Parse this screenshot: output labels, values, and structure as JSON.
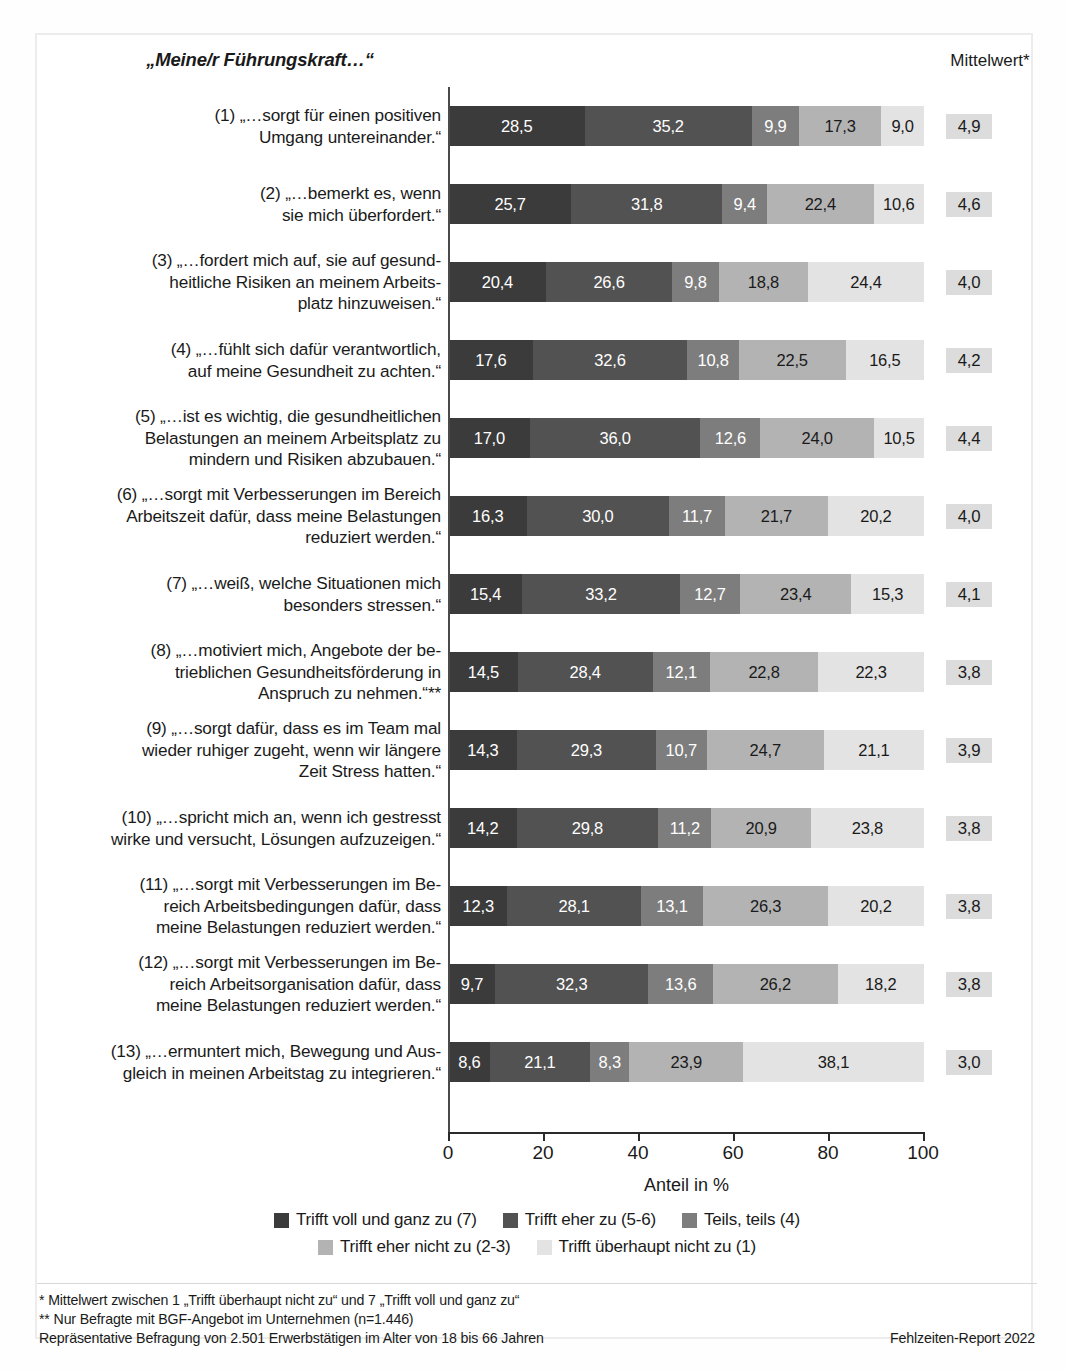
{
  "header": {
    "question_title": "„Meine/r Führungskraft…“",
    "mean_column_title": "Mittelwert*"
  },
  "axis": {
    "xlabel": "Anteil in %",
    "ticks": [
      "0",
      "20",
      "40",
      "60",
      "80",
      "100"
    ]
  },
  "legend": [
    {
      "label": "Trifft voll und ganz zu (7)",
      "color": "#3b3b3b"
    },
    {
      "label": "Trifft eher zu (5-6)",
      "color": "#525252"
    },
    {
      "label": "Teils, teils (4)",
      "color": "#7d7d7d"
    },
    {
      "label": "Trifft eher nicht zu (2-3)",
      "color": "#b3b3b3"
    },
    {
      "label": "Trifft überhaupt nicht zu (1)",
      "color": "#e3e3e3"
    }
  ],
  "footnotes": {
    "line1": "*  Mittelwert zwischen 1 „Trifft überhaupt nicht zu“ und 7 „Trifft voll und ganz zu“",
    "line2": "** Nur Befragte mit BGF-Angebot im Unternehmen (n=1.446)",
    "line3": "Repräsentative Befragung von 2.501 Erwerbstätigen im Alter von 18 bis 66 Jahren",
    "source": "Fehlzeiten-Report 2022"
  },
  "chart_data": {
    "type": "bar",
    "title": "„Meine/r Führungskraft…“",
    "xlabel": "Anteil in %",
    "ylabel": "",
    "xlim": [
      0,
      100
    ],
    "grid": false,
    "legend_position": "bottom",
    "stacked": true,
    "normalized_percent": true,
    "orientation": "horizontal",
    "categories": [
      "(1) „…sorgt für einen positiven Umgang untereinander.“",
      "(2) „…bemerkt es, wenn sie mich überfordert.“",
      "(3) „…fordert mich auf, sie auf gesundheitliche Risiken an meinem Arbeitsplatz hinzuweisen.“",
      "(4) „…fühlt sich dafür verantwortlich, auf meine Gesundheit zu achten.“",
      "(5) „…ist es wichtig, die gesundheitlichen Belastungen an meinem Arbeitsplatz zu mindern und Risiken abzubauen.“",
      "(6) „…sorgt mit Verbesserungen im Bereich Arbeitszeit dafür, dass meine Belastungen reduziert werden.“",
      "(7) „…weiß, welche Situationen mich besonders stressen.“",
      "(8) „…motiviert mich, Angebote der betrieblichen Gesundheitsförderung in Anspruch zu nehmen.“**",
      "(9) „…sorgt dafür, dass es im Team mal wieder ruhiger zugeht, wenn wir längere Zeit Stress hatten.“",
      "(10) „…spricht mich an, wenn ich gestresst wirke und versucht, Lösungen aufzuzeigen.“",
      "(11) „…sorgt mit Verbesserungen im Bereich Arbeitsbedingungen dafür, dass meine Belastungen reduziert werden.“",
      "(12) „…sorgt mit Verbesserungen im Bereich Arbeitsorganisation dafür, dass meine Belastungen reduziert werden.“",
      "(13) „…ermuntert mich, Bewegung und Ausgleich in meinen Arbeitstag zu integrieren.“"
    ],
    "series": [
      {
        "name": "Trifft voll und ganz zu (7)",
        "color": "#3b3b3b",
        "values": [
          28.5,
          25.7,
          20.4,
          17.6,
          17.0,
          16.3,
          15.4,
          14.5,
          14.3,
          14.2,
          12.3,
          9.7,
          8.6
        ]
      },
      {
        "name": "Trifft eher zu (5-6)",
        "color": "#525252",
        "values": [
          35.2,
          31.8,
          26.6,
          32.6,
          36.0,
          30.0,
          33.2,
          28.4,
          29.3,
          29.8,
          28.1,
          32.3,
          21.1
        ]
      },
      {
        "name": "Teils, teils (4)",
        "color": "#7d7d7d",
        "values": [
          9.9,
          9.4,
          9.8,
          10.8,
          12.6,
          11.7,
          12.7,
          12.1,
          10.7,
          11.2,
          13.1,
          13.6,
          8.3
        ]
      },
      {
        "name": "Trifft eher nicht zu (2-3)",
        "color": "#b3b3b3",
        "values": [
          17.3,
          22.4,
          18.8,
          22.5,
          24.0,
          21.7,
          23.4,
          22.8,
          24.7,
          20.9,
          26.3,
          26.2,
          23.9
        ]
      },
      {
        "name": "Trifft überhaupt nicht zu (1)",
        "color": "#e3e3e3",
        "values": [
          9.0,
          10.6,
          24.4,
          16.5,
          10.5,
          20.2,
          15.3,
          22.3,
          21.1,
          23.8,
          20.2,
          18.2,
          38.1
        ]
      }
    ],
    "mean_column_title": "Mittelwert*",
    "means": [
      "4,9",
      "4,6",
      "4,0",
      "4,2",
      "4,4",
      "4,0",
      "4,1",
      "3,8",
      "3,9",
      "3,8",
      "3,8",
      "3,8",
      "3,0"
    ]
  },
  "rows": [
    {
      "label_lines": [
        "(1) „…sorgt für einen positiven",
        "Umgang untereinander.“"
      ],
      "values": [
        "28,5",
        "35,2",
        "9,9",
        "17,3",
        "9,0"
      ],
      "mean": "4,9"
    },
    {
      "label_lines": [
        "(2) „…bemerkt es, wenn",
        "sie mich überfordert.“"
      ],
      "values": [
        "25,7",
        "31,8",
        "9,4",
        "22,4",
        "10,6"
      ],
      "mean": "4,6"
    },
    {
      "label_lines": [
        "(3) „…fordert mich auf, sie auf gesund-",
        "heitliche Risiken an meinem Arbeits-",
        "platz hinzuweisen.“"
      ],
      "values": [
        "20,4",
        "26,6",
        "9,8",
        "18,8",
        "24,4"
      ],
      "mean": "4,0"
    },
    {
      "label_lines": [
        "(4) „…fühlt sich dafür verantwortlich,",
        "auf meine Gesundheit zu achten.“"
      ],
      "values": [
        "17,6",
        "32,6",
        "10,8",
        "22,5",
        "16,5"
      ],
      "mean": "4,2"
    },
    {
      "label_lines": [
        "(5) „…ist es wichtig, die gesundheitlichen",
        "Belastungen an meinem Arbeitsplatz zu",
        "mindern und Risiken abzubauen.“"
      ],
      "values": [
        "17,0",
        "36,0",
        "12,6",
        "24,0",
        "10,5"
      ],
      "mean": "4,4"
    },
    {
      "label_lines": [
        "(6) „…sorgt mit Verbesserungen im Bereich",
        "Arbeitszeit dafür, dass meine Belastungen",
        "reduziert werden.“"
      ],
      "values": [
        "16,3",
        "30,0",
        "11,7",
        "21,7",
        "20,2"
      ],
      "mean": "4,0"
    },
    {
      "label_lines": [
        "(7) „…weiß, welche Situationen mich",
        "besonders stressen.“"
      ],
      "values": [
        "15,4",
        "33,2",
        "12,7",
        "23,4",
        "15,3"
      ],
      "mean": "4,1"
    },
    {
      "label_lines": [
        "(8) „…motiviert mich, Angebote der be-",
        "trieblichen Gesundheitsförderung in",
        "Anspruch zu nehmen.“**"
      ],
      "values": [
        "14,5",
        "28,4",
        "12,1",
        "22,8",
        "22,3"
      ],
      "mean": "3,8"
    },
    {
      "label_lines": [
        "(9) „…sorgt dafür, dass es im Team mal",
        "wieder ruhiger zugeht, wenn wir längere",
        "Zeit Stress hatten.“"
      ],
      "values": [
        "14,3",
        "29,3",
        "10,7",
        "24,7",
        "21,1"
      ],
      "mean": "3,9"
    },
    {
      "label_lines": [
        "(10) „…spricht mich an, wenn ich gestresst",
        "wirke und versucht, Lösungen aufzuzeigen.“"
      ],
      "values": [
        "14,2",
        "29,8",
        "11,2",
        "20,9",
        "23,8"
      ],
      "mean": "3,8"
    },
    {
      "label_lines": [
        "(11) „…sorgt mit Verbesserungen im Be-",
        "reich Arbeitsbedingungen dafür, dass",
        "meine Belastungen reduziert werden.“"
      ],
      "values": [
        "12,3",
        "28,1",
        "13,1",
        "26,3",
        "20,2"
      ],
      "mean": "3,8"
    },
    {
      "label_lines": [
        "(12) „…sorgt mit Verbesserungen im Be-",
        "reich Arbeitsorganisation dafür, dass",
        "meine Belastungen reduziert werden.“"
      ],
      "values": [
        "9,7",
        "32,3",
        "13,6",
        "26,2",
        "18,2"
      ],
      "mean": "3,8"
    },
    {
      "label_lines": [
        "(13) „…ermuntert mich, Bewegung und Aus-",
        "gleich in meinen Arbeitstag zu integrieren.“"
      ],
      "values": [
        "8,6",
        "21,1",
        "8,3",
        "23,9",
        "38,1"
      ],
      "mean": "3,0"
    }
  ]
}
